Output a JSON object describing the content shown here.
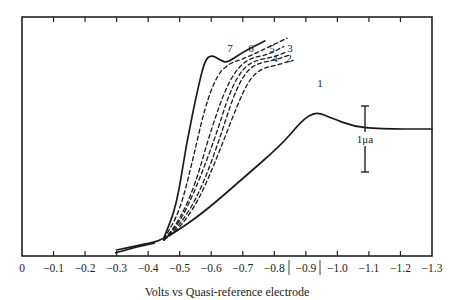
{
  "chart_data": {
    "type": "line",
    "title": "",
    "xlabel": "Volts vs Quasi-reference electrode",
    "ylabel": "",
    "x_ticks": [
      "0",
      "-0.1",
      "-0.2",
      "-0.3",
      "-0.4",
      "-0.5",
      "-0.6",
      "-0.7",
      "-0.8",
      "-0.9",
      "-1.0",
      "-1.1",
      "-1.2",
      "-1.3"
    ],
    "xlim": [
      0,
      -1.3
    ],
    "grid": false,
    "legend": "inline curve labels",
    "scale_bar": {
      "label": "1μa",
      "x": -1.08
    },
    "series": [
      {
        "name": "1",
        "style": "solid",
        "x": [
          -0.3,
          -0.38,
          -0.43,
          -0.48,
          -0.58,
          -0.7,
          -0.82,
          -0.88,
          -0.91,
          -0.94,
          -0.98,
          -1.05,
          -1.13,
          -1.3
        ],
        "y": [
          0.0,
          0.1,
          0.15,
          0.3,
          0.7,
          1.3,
          1.9,
          2.3,
          2.45,
          2.5,
          2.4,
          2.25,
          2.2,
          2.2
        ]
      },
      {
        "name": "2",
        "style": "dashed",
        "x": [
          -0.45,
          -0.5,
          -0.56,
          -0.62,
          -0.68,
          -0.72,
          -0.76,
          -0.8,
          -0.86
        ],
        "y": [
          0.18,
          0.4,
          0.9,
          1.7,
          2.6,
          3.1,
          3.3,
          3.35,
          3.45
        ]
      },
      {
        "name": "3",
        "style": "dashed",
        "x": [
          -0.45,
          -0.5,
          -0.56,
          -0.62,
          -0.67,
          -0.71,
          -0.75,
          -0.8,
          -0.85
        ],
        "y": [
          0.18,
          0.45,
          1.0,
          1.9,
          2.8,
          3.25,
          3.4,
          3.45,
          3.55
        ]
      },
      {
        "name": "4",
        "style": "dashed",
        "x": [
          -0.45,
          -0.5,
          -0.55,
          -0.61,
          -0.66,
          -0.7,
          -0.74,
          -0.79,
          -0.84
        ],
        "y": [
          0.18,
          0.5,
          1.1,
          2.0,
          2.9,
          3.3,
          3.45,
          3.5,
          3.6
        ]
      },
      {
        "name": "5",
        "style": "dashed",
        "x": [
          -0.45,
          -0.5,
          -0.55,
          -0.6,
          -0.65,
          -0.69,
          -0.73,
          -0.78,
          -0.83
        ],
        "y": [
          0.18,
          0.55,
          1.2,
          2.2,
          3.0,
          3.35,
          3.5,
          3.55,
          3.7
        ]
      },
      {
        "name": "6",
        "style": "dashed",
        "x": [
          -0.45,
          -0.5,
          -0.54,
          -0.58,
          -0.62,
          -0.66,
          -0.69,
          -0.75,
          -0.84
        ],
        "y": [
          0.2,
          0.7,
          1.6,
          2.6,
          3.2,
          3.4,
          3.45,
          3.6,
          3.85
        ]
      },
      {
        "name": "7",
        "style": "solid",
        "x": [
          -0.45,
          -0.49,
          -0.52,
          -0.56,
          -0.58,
          -0.6,
          -0.63,
          -0.65,
          -0.7,
          -0.77
        ],
        "y": [
          0.22,
          0.8,
          1.9,
          3.0,
          3.45,
          3.55,
          3.45,
          3.4,
          3.6,
          3.8
        ]
      }
    ]
  }
}
